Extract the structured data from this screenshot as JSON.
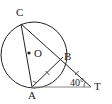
{
  "diagram": {
    "type": "geometry",
    "points": {
      "C": {
        "label": "C",
        "x": 21,
        "y": 24
      },
      "B": {
        "label": "B",
        "x": 63,
        "y": 57
      },
      "A": {
        "label": "A",
        "x": 32,
        "y": 87
      },
      "T": {
        "label": "T",
        "x": 91,
        "y": 87
      },
      "O": {
        "label": "O",
        "x": 31,
        "y": 53
      }
    },
    "circle": {
      "cx": 34,
      "cy": 55,
      "r": 33
    },
    "segments": [
      "CA",
      "CT",
      "AB",
      "AT"
    ],
    "equal_marks": [
      "AB",
      "BT"
    ],
    "angle_T": {
      "label": "40°",
      "value": 40
    },
    "angle_A_marked": true,
    "colors": {
      "stroke": "#222222",
      "tangent": "#888888"
    }
  }
}
